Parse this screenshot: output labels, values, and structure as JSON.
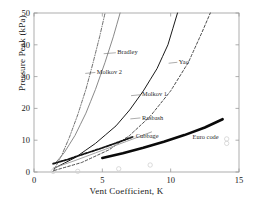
{
  "chart_data": {
    "type": "line",
    "title": "",
    "xlabel": "Vent Coefficient, K",
    "ylabel": "Pressure Peak (kPa)",
    "xlim": [
      0,
      15
    ],
    "ylim": [
      0,
      50
    ],
    "xticks": [
      "0",
      "5",
      "10",
      "15"
    ],
    "yticks": [
      "0",
      "10",
      "20",
      "30",
      "40",
      "50"
    ],
    "grid": false,
    "legend": "inline-annotations",
    "series": [
      {
        "name": "Bradley",
        "label": "Bradley",
        "style": "dash-dot",
        "color": "#4a4a4a",
        "width": 0.8,
        "points": [
          [
            1.4,
            0.2
          ],
          [
            2.0,
            5.0
          ],
          [
            2.6,
            11.0
          ],
          [
            3.2,
            18.0
          ],
          [
            3.8,
            26.0
          ],
          [
            4.3,
            34.0
          ],
          [
            4.8,
            42.5
          ],
          [
            5.2,
            50.0
          ]
        ]
      },
      {
        "name": "Molkov 2",
        "label": "Molkov 2",
        "style": "solid",
        "color": "#8a8a8a",
        "width": 1.0,
        "points": [
          [
            1.5,
            2.5
          ],
          [
            2.2,
            6.0
          ],
          [
            3.0,
            11.5
          ],
          [
            3.8,
            18.5
          ],
          [
            4.5,
            26.0
          ],
          [
            5.2,
            34.5
          ],
          [
            5.8,
            42.5
          ],
          [
            6.3,
            50.0
          ]
        ]
      },
      {
        "name": "Molkov 1",
        "label": "Molkov 1",
        "style": "solid",
        "color": "#1a1a1a",
        "width": 1.0,
        "points": [
          [
            1.5,
            1.2
          ],
          [
            3.0,
            4.5
          ],
          [
            4.5,
            9.0
          ],
          [
            6.0,
            14.5
          ],
          [
            7.0,
            19.5
          ],
          [
            8.0,
            25.5
          ],
          [
            9.0,
            32.5
          ],
          [
            9.8,
            40.0
          ],
          [
            10.5,
            50.0
          ]
        ]
      },
      {
        "name": "Yao",
        "label": "Yao",
        "style": "dashed",
        "color": "#2a2a2a",
        "width": 0.85,
        "points": [
          [
            1.5,
            0.5
          ],
          [
            3.5,
            3.0
          ],
          [
            5.5,
            7.0
          ],
          [
            7.0,
            11.5
          ],
          [
            8.5,
            17.5
          ],
          [
            10.0,
            25.5
          ],
          [
            11.3,
            34.5
          ],
          [
            12.3,
            44.0
          ],
          [
            12.9,
            50.0
          ]
        ]
      },
      {
        "name": "Rasbash",
        "label": "Rasbash",
        "style": "solid",
        "color": "#9a9a9a",
        "width": 0.9,
        "points": [
          [
            1.4,
            1.2
          ],
          [
            3.0,
            3.6
          ],
          [
            4.5,
            6.0
          ],
          [
            6.0,
            8.4
          ],
          [
            7.5,
            10.8
          ],
          [
            8.6,
            12.6
          ]
        ]
      },
      {
        "name": "Cubbage",
        "label": "Cubbage",
        "style": "thick-dashed",
        "color": "#141414",
        "width": 1.8,
        "points": [
          [
            1.4,
            2.6
          ],
          [
            2.5,
            4.0
          ],
          [
            3.6,
            5.6
          ],
          [
            4.8,
            7.3
          ],
          [
            5.8,
            8.8
          ],
          [
            6.7,
            10.2
          ],
          [
            7.2,
            11.0
          ]
        ]
      },
      {
        "name": "Euro code",
        "label": "Euro code",
        "style": "thick-solid",
        "color": "#0a0a0a",
        "width": 2.6,
        "points": [
          [
            5.0,
            4.4
          ],
          [
            6.5,
            5.9
          ],
          [
            8.0,
            7.6
          ],
          [
            9.5,
            9.5
          ],
          [
            11.0,
            11.6
          ],
          [
            12.5,
            14.0
          ],
          [
            13.8,
            16.6
          ]
        ]
      }
    ],
    "scatter_markers": {
      "name": "experimental-data-points",
      "marker": "open-circle",
      "color": "#cfcfcf",
      "points": [
        [
          1.4,
          0.2
        ],
        [
          3.2,
          0.2
        ],
        [
          6.2,
          1.0
        ],
        [
          8.5,
          2.2
        ],
        [
          14.1,
          9.0
        ],
        [
          14.1,
          10.4
        ]
      ]
    },
    "annotations": [
      {
        "label": "Bradley",
        "text_x": 6.1,
        "text_y": 37.0,
        "anchor_x": 5.1,
        "anchor_y": 37.2
      },
      {
        "label": "Molkov 2",
        "text_x": 4.6,
        "text_y": 30.8,
        "anchor_x": 3.75,
        "anchor_y": 31.0
      },
      {
        "label": "Yao",
        "text_x": 10.6,
        "text_y": 34.0,
        "anchor_x": 9.85,
        "anchor_y": 34.2
      },
      {
        "label": "Molkov 1",
        "text_x": 7.9,
        "text_y": 23.8,
        "anchor_x": 7.1,
        "anchor_y": 24.0
      },
      {
        "label": "Rasbash",
        "text_x": 7.9,
        "text_y": 16.5,
        "anchor_x": 7.05,
        "anchor_y": 16.7
      },
      {
        "label": "Cubbage",
        "text_x": 7.45,
        "text_y": 10.6,
        "anchor_x": 6.7,
        "anchor_y": 10.8
      },
      {
        "label": "Euro code",
        "text_x": 11.6,
        "text_y": 10.3,
        "anchor_x": 11.6,
        "anchor_y": 10.3
      }
    ]
  }
}
